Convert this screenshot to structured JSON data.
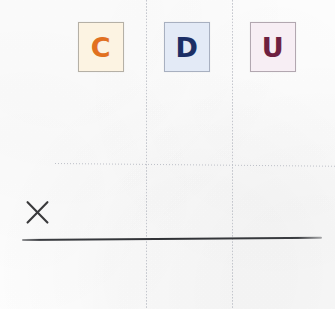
{
  "sheet": {
    "kind": "scanned-worksheet",
    "background_color": "#fefefe",
    "width": 335,
    "height": 309
  },
  "place_value_header": {
    "description": "Place value column headings",
    "tiles": [
      {
        "letter": "C",
        "meaning": "centenas",
        "text_color": "#e2701f",
        "background_color": "#fcf3e2",
        "border_color": "#b5b0a6",
        "x": 78,
        "y": 22,
        "w": 46,
        "h": 50
      },
      {
        "letter": "D",
        "meaning": "decenas",
        "text_color": "#1b2f66",
        "background_color": "#e3eaf6",
        "border_color": "#a8b0c0",
        "x": 164,
        "y": 22,
        "w": 46,
        "h": 50
      },
      {
        "letter": "U",
        "meaning": "unidades",
        "text_color": "#6e2040",
        "background_color": "#f7eef4",
        "border_color": "#b2a7b0",
        "x": 250,
        "y": 22,
        "w": 46,
        "h": 50
      }
    ]
  },
  "grid": {
    "vertical_rules": [
      {
        "name": "column-divider-left",
        "x": 146,
        "color": "#b9bcc4",
        "style": "dotted"
      },
      {
        "name": "column-divider-right",
        "x": 232,
        "color": "#b9bcc4",
        "style": "dotted"
      }
    ],
    "horizontal_rules": [
      {
        "name": "dotted-guide-line",
        "x": 55,
        "y": 163,
        "length": 280,
        "color": "#b3b6bf",
        "style": "dotted"
      }
    ],
    "solid_rules": [
      {
        "name": "writing-base-line",
        "x": 22,
        "y": 239,
        "length": 300,
        "color": "#303236",
        "style": "solid"
      }
    ]
  },
  "annotations": {
    "x_mark": {
      "name": "x-mark",
      "glyph": "X",
      "color": "#3a3a3c",
      "x": 26,
      "y": 201,
      "size": 23
    }
  },
  "palette": {
    "paper": "#fefefe",
    "rule_dotted": "#b9bcc4",
    "rule_solid": "#303236",
    "ink_orange": "#e2701f",
    "ink_navy": "#1b2f66",
    "ink_maroon": "#6e2040",
    "ink_pencil": "#3a3a3c"
  }
}
